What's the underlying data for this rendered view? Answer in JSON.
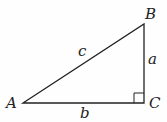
{
  "diagram": {
    "vertices": {
      "A": {
        "label": "A",
        "x": 23,
        "y": 103
      },
      "B": {
        "label": "B",
        "x": 144,
        "y": 24
      },
      "C": {
        "label": "C",
        "x": 144,
        "y": 103
      }
    },
    "sides": {
      "a": {
        "label": "a",
        "between": [
          "B",
          "C"
        ]
      },
      "b": {
        "label": "b",
        "between": [
          "A",
          "C"
        ]
      },
      "c": {
        "label": "c",
        "between": [
          "A",
          "B"
        ]
      }
    },
    "right_angle_at": "C",
    "stroke_color": "#222222"
  }
}
